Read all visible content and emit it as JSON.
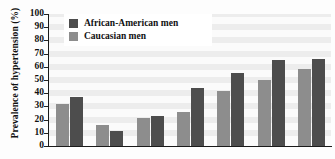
{
  "chart_data": {
    "type": "bar",
    "title": "",
    "xlabel": "",
    "ylabel": "Prevalence of hypertension (%)",
    "ylim": [
      0,
      100
    ],
    "yticks": [
      0,
      10,
      20,
      30,
      40,
      50,
      60,
      70,
      80,
      90,
      100
    ],
    "grid": true,
    "legend_position": "top-left",
    "categories": [
      "1",
      "2",
      "3",
      "4",
      "5",
      "6",
      "7"
    ],
    "series": [
      {
        "name": "Caucasian men",
        "color": "#8d8d8d",
        "values": [
          32,
          16,
          21,
          26,
          42,
          50,
          58
        ]
      },
      {
        "name": "African-American men",
        "color": "#4d4d4d",
        "values": [
          37,
          11,
          23,
          44,
          55,
          65,
          66
        ]
      }
    ],
    "series_draw_order": [
      "Caucasian men",
      "African-American men"
    ]
  },
  "legend": {
    "items": [
      {
        "label": "African-American men",
        "color": "#4d4d4d"
      },
      {
        "label": "Caucasian men",
        "color": "#8d8d8d"
      }
    ]
  },
  "axis": {
    "y_title": "Prevalence of hypertension (%)"
  }
}
